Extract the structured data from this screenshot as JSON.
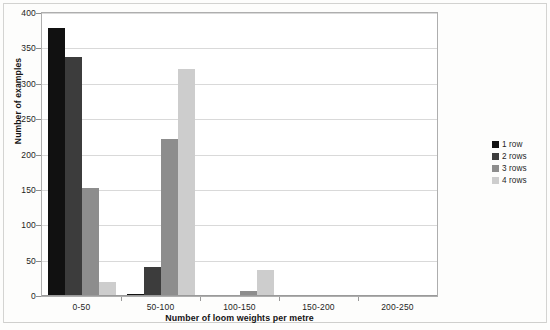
{
  "chart_data": {
    "type": "bar",
    "title": "",
    "xlabel": "Number of loom weights per metre",
    "ylabel": "Number of examples",
    "categories": [
      "0-50",
      "50-100",
      "100-150",
      "150-200",
      "200-250"
    ],
    "series": [
      {
        "name": "1 row",
        "color": "#111111",
        "values": [
          378,
          1,
          0,
          0,
          0
        ]
      },
      {
        "name": "2 rows",
        "color": "#3c3c3c",
        "values": [
          337,
          40,
          0,
          0,
          0
        ]
      },
      {
        "name": "3 rows",
        "color": "#8d8d8d",
        "values": [
          151,
          220,
          5,
          0,
          0
        ]
      },
      {
        "name": "4 rows",
        "color": "#cdcdcd",
        "values": [
          18,
          320,
          35,
          0,
          0
        ]
      }
    ],
    "ylim": [
      0,
      400
    ],
    "yticks": [
      0,
      50,
      100,
      150,
      200,
      250,
      300,
      350,
      400
    ],
    "ytick_labels": [
      "0",
      "50",
      "100",
      "150",
      "200",
      "250",
      "300",
      "350",
      "400"
    ],
    "grid": true,
    "legend_position": "right",
    "legend_entries": [
      "1 row",
      "2 rows",
      "3 rows",
      "4 rows"
    ]
  }
}
